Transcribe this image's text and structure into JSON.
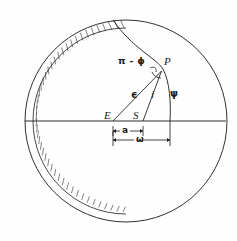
{
  "figure": {
    "type": "geometry-diagram",
    "background_color": "#fefefe",
    "stroke_color": "#1a1a1a",
    "points": [
      {
        "id": "E",
        "label": "E",
        "x": 113,
        "y": 121,
        "label_x": 105,
        "label_y": 111
      },
      {
        "id": "S",
        "label": "S",
        "x": 143,
        "y": 121,
        "label_x": 134,
        "label_y": 111
      },
      {
        "id": "P",
        "label": "P",
        "x": 163,
        "y": 69,
        "label_x": 163,
        "label_y": 59
      }
    ],
    "angles": [
      {
        "id": "pi-minus-phi",
        "label": "π - ϕ",
        "x": 118,
        "y": 60
      },
      {
        "id": "epsilon",
        "label": "ϵ",
        "x": 133,
        "y": 95
      },
      {
        "id": "inclination",
        "label": "i",
        "x": 152,
        "y": 94
      },
      {
        "id": "psi",
        "label": "ψ",
        "x": 172,
        "y": 94
      }
    ],
    "dimensions": [
      {
        "id": "a",
        "label": "a",
        "from_x": 113,
        "to_x": 143,
        "y": 131,
        "label_x": 124,
        "label_y": 126
      },
      {
        "id": "omega",
        "label": "ω",
        "from_x": 113,
        "to_x": 170,
        "y": 140,
        "label_x": 138,
        "label_y": 135
      }
    ],
    "circle": {
      "cx": 126,
      "cy": 121,
      "r": 101
    },
    "hatched_band": {
      "side": "left",
      "inner_offset": 0,
      "outer_offset": 7,
      "hatch_count": 44
    },
    "baseline": {
      "from_x": 25,
      "to_x": 226,
      "y": 121
    },
    "orbit_arc": {
      "start_x": 113,
      "start_y": 20,
      "end_x": 170,
      "end_y": 121,
      "through_x": 163,
      "through_y": 69
    }
  }
}
